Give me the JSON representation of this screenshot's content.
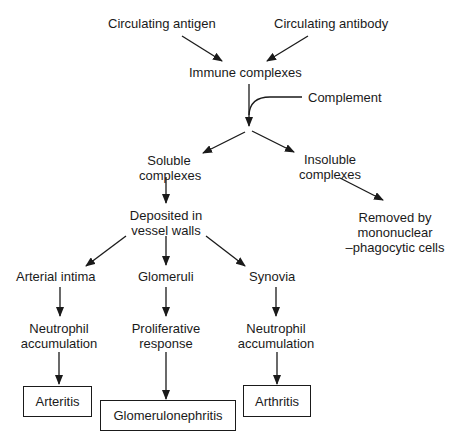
{
  "diagram": {
    "nodes": {
      "circulating_antigen": "Circulating antigen",
      "circulating_antibody": "Circulating antibody",
      "immune_complexes": "Immune complexes",
      "complement": "Complement",
      "soluble_l1": "Soluble",
      "soluble_l2": "complexes",
      "insoluble_l1": "Insoluble",
      "insoluble_l2": "complexes",
      "removed_l1": "Removed by",
      "removed_l2": "mononuclear",
      "removed_l3": "–phagocytic cells",
      "deposited_l1": "Deposited in",
      "deposited_l2": "vessel walls",
      "arterial_intima": "Arterial intima",
      "glomeruli": "Glomeruli",
      "synovia": "Synovia",
      "neutrophil1_l1": "Neutrophil",
      "neutrophil1_l2": "accumulation",
      "proliferative_l1": "Proliferative",
      "proliferative_l2": "response",
      "neutrophil2_l1": "Neutrophil",
      "neutrophil2_l2": "accumulation",
      "arteritis": "Arteritis",
      "glomerulonephritis": "Glomerulonephritis",
      "arthritis": "Arthritis"
    },
    "edges": [
      [
        "Circulating antigen",
        "Immune complexes"
      ],
      [
        "Circulating antibody",
        "Immune complexes"
      ],
      [
        "Immune complexes",
        "Soluble complexes"
      ],
      [
        "Immune complexes",
        "Insoluble complexes"
      ],
      [
        "Complement",
        "Immune complexes path"
      ],
      [
        "Insoluble complexes",
        "Removed by mononuclear-phagocytic cells"
      ],
      [
        "Soluble complexes",
        "Deposited in vessel walls"
      ],
      [
        "Deposited in vessel walls",
        "Arterial intima"
      ],
      [
        "Deposited in vessel walls",
        "Glomeruli"
      ],
      [
        "Deposited in vessel walls",
        "Synovia"
      ],
      [
        "Arterial intima",
        "Neutrophil accumulation"
      ],
      [
        "Glomeruli",
        "Proliferative response"
      ],
      [
        "Synovia",
        "Neutrophil accumulation"
      ],
      [
        "Neutrophil accumulation",
        "Arteritis"
      ],
      [
        "Proliferative response",
        "Glomerulonephritis"
      ],
      [
        "Neutrophil accumulation",
        "Arthritis"
      ]
    ]
  }
}
